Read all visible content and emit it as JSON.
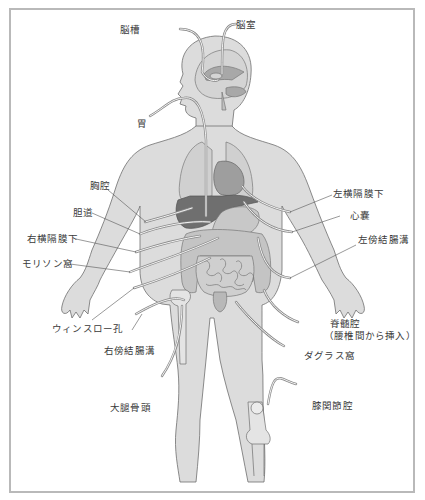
{
  "diagram": {
    "title": "",
    "colors": {
      "body_fill": "#dcdcdc",
      "body_outline": "#6e6e6e",
      "organ_light": "#c4c4c4",
      "organ_mid": "#a8a8a8",
      "organ_dark": "#707070",
      "tube": "#8a8a8a",
      "frame_border": "#b9b9b9",
      "label_text": "#3a3a3a"
    },
    "labels": {
      "ventricle": "脳室",
      "cistern": "脳槽",
      "stomach": "胃",
      "thoracic_cavity": "胸腔",
      "bile_duct": "胆道",
      "right_subphrenic": "右横隔膜下",
      "morison_pouch": "モリソン窩",
      "winslow_foramen": "ウィンスロー孔",
      "right_paracolic": "右傍結腸溝",
      "femoral_head": "大腿骨頭",
      "left_subphrenic": "左横隔膜下",
      "pericardium": "心嚢",
      "left_paracolic": "左傍結腸溝",
      "spinal_cavity": "脊髄腔",
      "spinal_cavity_note": "（腰椎間から挿入）",
      "douglas_pouch": "ダグラス窩",
      "knee_joint_cavity": "膝関節腔"
    }
  }
}
